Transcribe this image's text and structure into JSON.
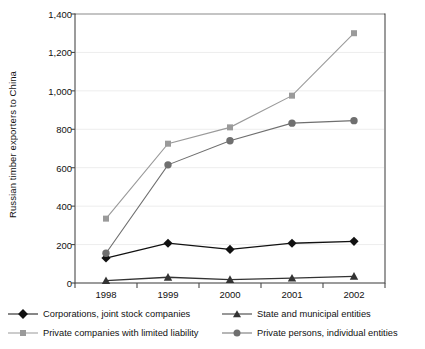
{
  "chart_data": {
    "type": "line",
    "title": "",
    "xlabel": "",
    "ylabel": "Russian timber exporters to China",
    "categories": [
      "1998",
      "1999",
      "2000",
      "2001",
      "2002"
    ],
    "ylim": [
      0,
      1400
    ],
    "ytick_labels": [
      "0",
      "200",
      "400",
      "600",
      "800",
      "1,000",
      "1,200",
      "1,400"
    ],
    "ytick_values": [
      0,
      200,
      400,
      600,
      800,
      1000,
      1200,
      1400
    ],
    "grid": true,
    "legend_position": "bottom",
    "series": [
      {
        "name": "Corporations, joint stock companies",
        "marker": "diamond",
        "color": "#111111",
        "values": [
          130,
          207,
          175,
          207,
          217
        ]
      },
      {
        "name": "Private companies with limited liability",
        "marker": "square",
        "color": "#9a9a9a",
        "values": [
          335,
          725,
          810,
          975,
          1300
        ]
      },
      {
        "name": "State and municipal entities",
        "marker": "triangle",
        "color": "#333333",
        "values": [
          12,
          30,
          18,
          25,
          35
        ]
      },
      {
        "name": "Private persons, individual entities",
        "marker": "circle",
        "color": "#6f6f6f",
        "values": [
          155,
          615,
          740,
          832,
          845
        ]
      }
    ]
  }
}
